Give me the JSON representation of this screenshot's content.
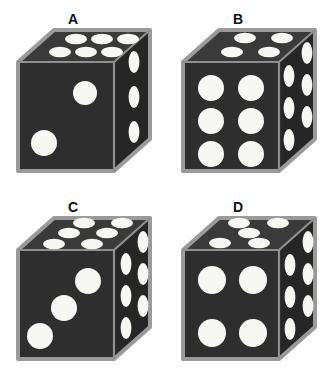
{
  "figure": {
    "background_color": "#ffffff",
    "layout": {
      "columns": 2,
      "rows": 2
    }
  },
  "colors": {
    "die_body": "#2e2e2e",
    "die_top_face": "#3a3a3a",
    "die_right_face": "#262626",
    "bevel_edge": "#9a9a9a",
    "pip": "#f7f7f4",
    "label_text": "#111111",
    "background": "#ffffff"
  },
  "dice": [
    {
      "label": "A",
      "faces": {
        "top": {
          "value": 6,
          "arrangement": "two-rows-of-three"
        },
        "front": {
          "value": 2,
          "arrangement": "diagonal"
        },
        "right": {
          "value": 3,
          "arrangement": "single-column-of-three"
        }
      }
    },
    {
      "label": "B",
      "faces": {
        "top": {
          "value": 4,
          "arrangement": "two-by-two"
        },
        "front": {
          "value": 6,
          "arrangement": "two-columns-of-three"
        },
        "right": {
          "value": 6,
          "arrangement": "two-columns-of-three"
        }
      }
    },
    {
      "label": "C",
      "faces": {
        "top": {
          "value": 6,
          "arrangement": "three-rows-of-two"
        },
        "front": {
          "value": 3,
          "arrangement": "diagonal"
        },
        "right": {
          "value": 6,
          "arrangement": "two-columns-of-three"
        }
      }
    },
    {
      "label": "D",
      "faces": {
        "top": {
          "value": 5,
          "arrangement": "quincunx"
        },
        "front": {
          "value": 4,
          "arrangement": "two-by-two"
        },
        "right": {
          "value": 6,
          "arrangement": "two-columns-of-three"
        }
      }
    }
  ]
}
